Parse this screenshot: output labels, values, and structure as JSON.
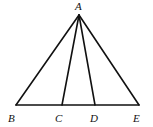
{
  "figure": {
    "type": "triangle-with-cevians",
    "points": {
      "A": {
        "label": "A",
        "x": 79,
        "y": 15
      },
      "B": {
        "label": "B",
        "x": 16,
        "y": 105
      },
      "C": {
        "label": "C",
        "x": 62,
        "y": 105
      },
      "D": {
        "label": "D",
        "x": 95,
        "y": 105
      },
      "E": {
        "label": "E",
        "x": 139,
        "y": 105
      }
    },
    "segments": [
      [
        "A",
        "B"
      ],
      [
        "A",
        "C"
      ],
      [
        "A",
        "D"
      ],
      [
        "A",
        "E"
      ],
      [
        "B",
        "E"
      ]
    ],
    "labels": {
      "A": "A",
      "B": "B",
      "C": "C",
      "D": "D",
      "E": "E"
    }
  }
}
